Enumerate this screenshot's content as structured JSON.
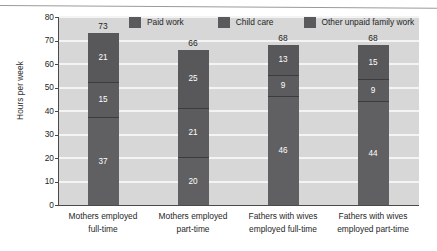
{
  "chart_data": {
    "type": "bar",
    "subtype": "stacked-bar",
    "title": "",
    "xlabel": "",
    "ylabel": "Hours per week",
    "ylim": [
      0,
      80
    ],
    "yticks": [
      0,
      10,
      20,
      30,
      40,
      50,
      60,
      70,
      80
    ],
    "ytick_labels": [
      "0",
      "10",
      "20",
      "30",
      "40",
      "50",
      "60",
      "70",
      "80"
    ],
    "grid": true,
    "grid_axis": "y",
    "legend_position": "top",
    "categories": [
      "Mothers employed full-time",
      "Mothers employed part-time",
      "Fathers with wives employed full-time",
      "Fathers with wives employed part-time"
    ],
    "category_lines": [
      [
        "Mothers employed",
        "full-time"
      ],
      [
        "Mothers employed",
        "part-time"
      ],
      [
        "Fathers with wives",
        "employed full-time"
      ],
      [
        "Fathers with wives",
        "employed part-time"
      ]
    ],
    "series": [
      {
        "name": "Paid work",
        "values": [
          37,
          20,
          46,
          44
        ],
        "color": "#606062"
      },
      {
        "name": "Child care",
        "values": [
          15,
          21,
          9,
          9
        ],
        "color": "#5c5c5e"
      },
      {
        "name": "Other unpaid family work",
        "values": [
          21,
          25,
          13,
          15
        ],
        "color": "#58585a"
      }
    ],
    "totals": [
      73,
      66,
      68,
      68
    ],
    "total_labels": [
      "73",
      "66",
      "68",
      "68"
    ],
    "segment_labels": [
      {
        "paid": "37",
        "child": "15",
        "other": "21"
      },
      {
        "paid": "20",
        "child": "21",
        "other": "25"
      },
      {
        "paid": "46",
        "child": "9",
        "other": "13"
      },
      {
        "paid": "44",
        "child": "9",
        "other": "15"
      }
    ],
    "plot_background": "#d7d7d7",
    "gridline_color": "#f4f4f4",
    "axis_color": "#4a4a4a",
    "value_label_color": "#ffffff"
  },
  "legend": {
    "items": [
      {
        "label": "Paid work",
        "color": "#606062"
      },
      {
        "label": "Child care",
        "color": "#5c5c5e"
      },
      {
        "label": "Other unpaid family work",
        "color": "#58585a"
      }
    ]
  },
  "axis": {
    "y_title": "Hours per week"
  }
}
